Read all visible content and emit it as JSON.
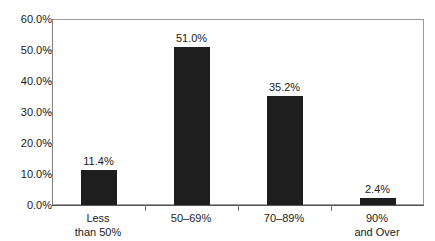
{
  "chart_data": {
    "type": "bar",
    "title": "",
    "subtitle": "",
    "xlabel": "",
    "ylabel": "",
    "categories": [
      "Less\nthan 50%",
      "50–69%",
      "70–89%",
      "90%\nand Over"
    ],
    "category_lines": [
      [
        "Less",
        "than 50%"
      ],
      [
        "50–69%",
        ""
      ],
      [
        "70–89%",
        ""
      ],
      [
        "90%",
        "and Over"
      ]
    ],
    "values": [
      11.4,
      51.0,
      35.2,
      2.4
    ],
    "value_labels": [
      "11.4%",
      "51.0%",
      "35.2%",
      "2.4%"
    ],
    "ylim": [
      0,
      60
    ],
    "ytick_values": [
      0,
      10,
      20,
      30,
      40,
      50,
      60
    ],
    "ytick_labels": [
      "0.0%",
      "10.0%",
      "20.0%",
      "30.0%",
      "40.0%",
      "50.0%",
      "60.0%"
    ],
    "grid": false,
    "legend": null,
    "bar_color": "#1e1e1e",
    "frame_color": "#9a9a9a",
    "axis_color": "#555555",
    "background": "#ffffff"
  }
}
